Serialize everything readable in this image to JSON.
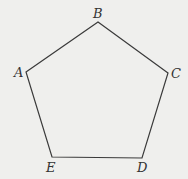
{
  "diagram": {
    "type": "pentagon",
    "background": "#efefed",
    "stroke": "#3a3a3a",
    "vertices": [
      {
        "label": "A",
        "x": 26,
        "y": 72,
        "lx": 14,
        "ly": 77
      },
      {
        "label": "B",
        "x": 98,
        "y": 22,
        "lx": 93,
        "ly": 18
      },
      {
        "label": "C",
        "x": 168,
        "y": 73,
        "lx": 171,
        "ly": 78
      },
      {
        "label": "D",
        "x": 142,
        "y": 158,
        "lx": 137,
        "ly": 172
      },
      {
        "label": "E",
        "x": 52,
        "y": 157,
        "lx": 46,
        "ly": 172
      }
    ]
  }
}
